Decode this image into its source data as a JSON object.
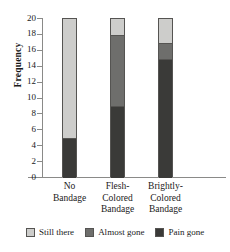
{
  "chart_data": {
    "type": "bar",
    "stacked": true,
    "title": "",
    "xlabel": "",
    "ylabel": "Frequency",
    "categories": [
      "No\nBandage",
      "Flesh-\nColored\nBandage",
      "Brightly-\nColored\nBandage"
    ],
    "category_lines": [
      [
        "No",
        "Bandage"
      ],
      [
        "Flesh-",
        "Colored",
        "Bandage"
      ],
      [
        "Brightly-",
        "Colored",
        "Bandage"
      ]
    ],
    "series": [
      {
        "name": "Pain gone",
        "color": "#3a3a38",
        "values": [
          5,
          9,
          15
        ]
      },
      {
        "name": "Almost gone",
        "color": "#6e6e6c",
        "values": [
          0,
          9,
          2
        ]
      },
      {
        "name": "Still there",
        "color": "#cdcdcb",
        "values": [
          15,
          2,
          3
        ]
      }
    ],
    "stack_order_bottom_to_top": [
      "Pain gone",
      "Almost gone",
      "Still there"
    ],
    "totals": [
      20,
      20,
      20
    ],
    "ylim": [
      0,
      20
    ],
    "ytick_step": 2,
    "yticks": [
      0,
      2,
      4,
      6,
      8,
      10,
      12,
      14,
      16,
      18,
      20
    ],
    "ytick_labels": [
      "0",
      "2",
      "4",
      "6",
      "8",
      "10",
      "12",
      "14",
      "16",
      "18",
      "20"
    ],
    "grid": false,
    "legend_position": "bottom"
  },
  "axis": {
    "y_title": "Frequency",
    "ticks": [
      {
        "value": 20,
        "label": "20"
      },
      {
        "value": 18,
        "label": "18"
      },
      {
        "value": 16,
        "label": "16"
      },
      {
        "value": 14,
        "label": "14"
      },
      {
        "value": 12,
        "label": "12"
      },
      {
        "value": 10,
        "label": "10"
      },
      {
        "value": 8,
        "label": "8"
      },
      {
        "value": 6,
        "label": "6"
      },
      {
        "value": 4,
        "label": "4"
      },
      {
        "value": 2,
        "label": "2"
      },
      {
        "value": 0,
        "label": "0"
      }
    ]
  },
  "categories": [
    {
      "line1": "No",
      "line2": "Bandage",
      "line3": ""
    },
    {
      "line1": "Flesh-",
      "line2": "Colored",
      "line3": "Bandage"
    },
    {
      "line1": "Brightly-",
      "line2": "Colored",
      "line3": "Bandage"
    }
  ],
  "legend": {
    "items": [
      {
        "label": "Still there",
        "color": "#cdcdcb"
      },
      {
        "label": "Almost gone",
        "color": "#6e6e6c"
      },
      {
        "label": "Pain gone",
        "color": "#3a3a38"
      }
    ]
  },
  "colors": {
    "still_there": "#cdcdcb",
    "almost_gone": "#6e6e6c",
    "pain_gone": "#3a3a38",
    "axis": "#8a8a88",
    "outline": "#555452",
    "background": "#ffffff",
    "text": "#1a1a1a"
  }
}
